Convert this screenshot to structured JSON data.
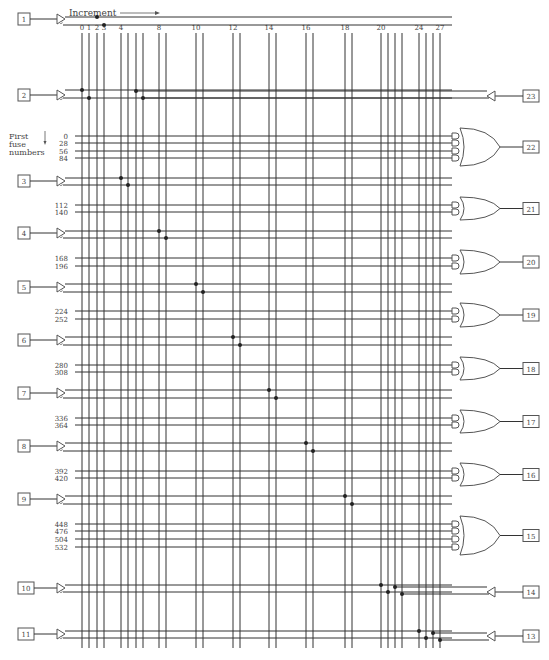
{
  "header": {
    "increment_label": "Increment",
    "first_fuse_label_lines": [
      "First",
      "fuse",
      "numbers"
    ]
  },
  "columns": {
    "labels": [
      {
        "index": 0,
        "text": "0"
      },
      {
        "index": 1,
        "text": "1"
      },
      {
        "index": 2,
        "text": "2"
      },
      {
        "index": 3,
        "text": "3"
      },
      {
        "index": 4,
        "text": "4"
      },
      {
        "index": 8,
        "text": "8"
      },
      {
        "index": 10,
        "text": "10"
      },
      {
        "index": 12,
        "text": "12"
      },
      {
        "index": 14,
        "text": "14"
      },
      {
        "index": 16,
        "text": "16"
      },
      {
        "index": 18,
        "text": "18"
      },
      {
        "index": 20,
        "text": "20"
      },
      {
        "index": 24,
        "text": "24"
      },
      {
        "index": 27,
        "text": "27"
      }
    ],
    "x": [
      82,
      89,
      97,
      104,
      121,
      128,
      136,
      143,
      159,
      166,
      196,
      203,
      233,
      240,
      269,
      276,
      306,
      313,
      345,
      352,
      381,
      388,
      395,
      402,
      419,
      426,
      433,
      440
    ],
    "top": 33,
    "bottom": 648
  },
  "input_pins": [
    {
      "pin": "1",
      "y": 19,
      "row_true": 17,
      "row_comp": 25,
      "col_true": 2,
      "col_comp": 3
    },
    {
      "pin": "2",
      "y": 95,
      "row_true": 90,
      "row_comp": 98,
      "col_true": 0,
      "col_comp": 1
    },
    {
      "pin": "3",
      "y": 181,
      "row_true": 178,
      "row_comp": 185,
      "col_true": 4,
      "col_comp": 5
    },
    {
      "pin": "4",
      "y": 233,
      "row_true": 231,
      "row_comp": 238,
      "col_true": 8,
      "col_comp": 9
    },
    {
      "pin": "5",
      "y": 287,
      "row_true": 284,
      "row_comp": 292,
      "col_true": 10,
      "col_comp": 11
    },
    {
      "pin": "6",
      "y": 340,
      "row_true": 337,
      "row_comp": 345,
      "col_true": 12,
      "col_comp": 13
    },
    {
      "pin": "7",
      "y": 393,
      "row_true": 390,
      "row_comp": 398,
      "col_true": 14,
      "col_comp": 15
    },
    {
      "pin": "8",
      "y": 446,
      "row_true": 443,
      "row_comp": 451,
      "col_true": 16,
      "col_comp": 17
    },
    {
      "pin": "9",
      "y": 499,
      "row_true": 496,
      "row_comp": 504,
      "col_true": 18,
      "col_comp": 19
    },
    {
      "pin": "10",
      "y": 588,
      "row_true": 585,
      "row_comp": 592,
      "col_true": 20,
      "col_comp": 21
    },
    {
      "pin": "11",
      "y": 634,
      "row_true": 631,
      "row_comp": 638,
      "col_true": 24,
      "col_comp": 25
    }
  ],
  "feedback_pins": [
    {
      "pin": "23",
      "y": 96,
      "row_true": 91,
      "row_comp": 98,
      "col_true": 6,
      "col_comp": 7
    },
    {
      "pin": "14",
      "y": 592,
      "row_true": 587,
      "row_comp": 594,
      "col_true": 22,
      "col_comp": 23
    },
    {
      "pin": "13",
      "y": 636,
      "row_true": 633,
      "row_comp": 640,
      "col_true": 26,
      "col_comp": 27
    }
  ],
  "output_groups": [
    {
      "pin": "22",
      "fuses": [
        "0",
        "28",
        "56",
        "84"
      ],
      "rows": [
        136,
        143,
        151,
        158
      ]
    },
    {
      "pin": "21",
      "fuses": [
        "112",
        "140"
      ],
      "rows": [
        205,
        212
      ]
    },
    {
      "pin": "20",
      "fuses": [
        "168",
        "196"
      ],
      "rows": [
        258,
        266
      ]
    },
    {
      "pin": "19",
      "fuses": [
        "224",
        "252"
      ],
      "rows": [
        311,
        319
      ]
    },
    {
      "pin": "18",
      "fuses": [
        "280",
        "308"
      ],
      "rows": [
        365,
        372
      ]
    },
    {
      "pin": "17",
      "fuses": [
        "336",
        "364"
      ],
      "rows": [
        418,
        425
      ]
    },
    {
      "pin": "16",
      "fuses": [
        "392",
        "420"
      ],
      "rows": [
        471,
        478
      ]
    },
    {
      "pin": "15",
      "fuses": [
        "448",
        "476",
        "504",
        "532"
      ],
      "rows": [
        524,
        531,
        539,
        547
      ]
    }
  ]
}
